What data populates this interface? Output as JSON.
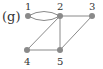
{
  "diagram": {
    "caption": "(g)",
    "colors": {
      "edge": "#8a8a8a",
      "node": "#8a8a8a",
      "text": "#333333"
    },
    "nodes": [
      {
        "id": "1",
        "label": "1",
        "x": 28,
        "y": 16,
        "label_pos": "above"
      },
      {
        "id": "2",
        "label": "2",
        "x": 60,
        "y": 16,
        "label_pos": "above"
      },
      {
        "id": "3",
        "label": "3",
        "x": 92,
        "y": 16,
        "label_pos": "above"
      },
      {
        "id": "4",
        "label": "4",
        "x": 27,
        "y": 50,
        "label_pos": "below"
      },
      {
        "id": "5",
        "label": "5",
        "x": 60,
        "y": 50,
        "label_pos": "below"
      }
    ],
    "edges": [
      {
        "from": "1",
        "to": "2",
        "type": "curve-up"
      },
      {
        "from": "1",
        "to": "2",
        "type": "curve-down"
      },
      {
        "from": "2",
        "to": "3",
        "type": "straight"
      },
      {
        "from": "2",
        "to": "4",
        "type": "straight"
      },
      {
        "from": "2",
        "to": "5",
        "type": "straight"
      },
      {
        "from": "3",
        "to": "5",
        "type": "straight"
      },
      {
        "from": "4",
        "to": "5",
        "type": "straight"
      }
    ]
  }
}
